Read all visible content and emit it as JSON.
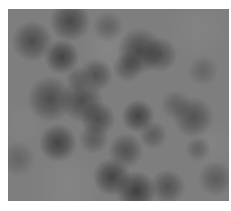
{
  "image": {
    "description": "Blurry grayscale texture with scattered dark circular blobs on a mid-gray field",
    "background_color": "#7e7e7e",
    "frame": {
      "x": 8,
      "y": 9,
      "width": 221,
      "height": 192
    },
    "blobs": [
      {
        "x": 62,
        "y": 12,
        "r": 16,
        "a": 0.55
      },
      {
        "x": 24,
        "y": 32,
        "r": 16,
        "a": 0.5
      },
      {
        "x": 54,
        "y": 48,
        "r": 14,
        "a": 0.6
      },
      {
        "x": 88,
        "y": 66,
        "r": 13,
        "a": 0.45
      },
      {
        "x": 42,
        "y": 90,
        "r": 18,
        "a": 0.5
      },
      {
        "x": 74,
        "y": 92,
        "r": 17,
        "a": 0.5
      },
      {
        "x": 90,
        "y": 110,
        "r": 14,
        "a": 0.5
      },
      {
        "x": 50,
        "y": 134,
        "r": 15,
        "a": 0.6
      },
      {
        "x": 86,
        "y": 130,
        "r": 12,
        "a": 0.35
      },
      {
        "x": 132,
        "y": 42,
        "r": 18,
        "a": 0.55
      },
      {
        "x": 152,
        "y": 46,
        "r": 14,
        "a": 0.45
      },
      {
        "x": 120,
        "y": 58,
        "r": 12,
        "a": 0.4
      },
      {
        "x": 130,
        "y": 107,
        "r": 13,
        "a": 0.6
      },
      {
        "x": 185,
        "y": 108,
        "r": 16,
        "a": 0.45
      },
      {
        "x": 168,
        "y": 96,
        "r": 12,
        "a": 0.3
      },
      {
        "x": 145,
        "y": 126,
        "r": 11,
        "a": 0.35
      },
      {
        "x": 118,
        "y": 142,
        "r": 14,
        "a": 0.45
      },
      {
        "x": 104,
        "y": 168,
        "r": 15,
        "a": 0.6
      },
      {
        "x": 128,
        "y": 182,
        "r": 16,
        "a": 0.65
      },
      {
        "x": 160,
        "y": 178,
        "r": 14,
        "a": 0.45
      },
      {
        "x": 208,
        "y": 170,
        "r": 14,
        "a": 0.35
      },
      {
        "x": 100,
        "y": 18,
        "r": 12,
        "a": 0.3
      },
      {
        "x": 195,
        "y": 62,
        "r": 12,
        "a": 0.25
      },
      {
        "x": 10,
        "y": 150,
        "r": 14,
        "a": 0.25
      },
      {
        "x": 190,
        "y": 140,
        "r": 10,
        "a": 0.3
      },
      {
        "x": 70,
        "y": 70,
        "r": 10,
        "a": 0.3
      }
    ],
    "light_patches": [
      {
        "x": 100,
        "y": 40,
        "r": 20,
        "a": 0.18
      },
      {
        "x": 190,
        "y": 20,
        "r": 24,
        "a": 0.12
      },
      {
        "x": 60,
        "y": 175,
        "r": 26,
        "a": 0.15
      },
      {
        "x": 205,
        "y": 135,
        "r": 18,
        "a": 0.12
      },
      {
        "x": 15,
        "y": 115,
        "r": 16,
        "a": 0.1
      }
    ]
  }
}
